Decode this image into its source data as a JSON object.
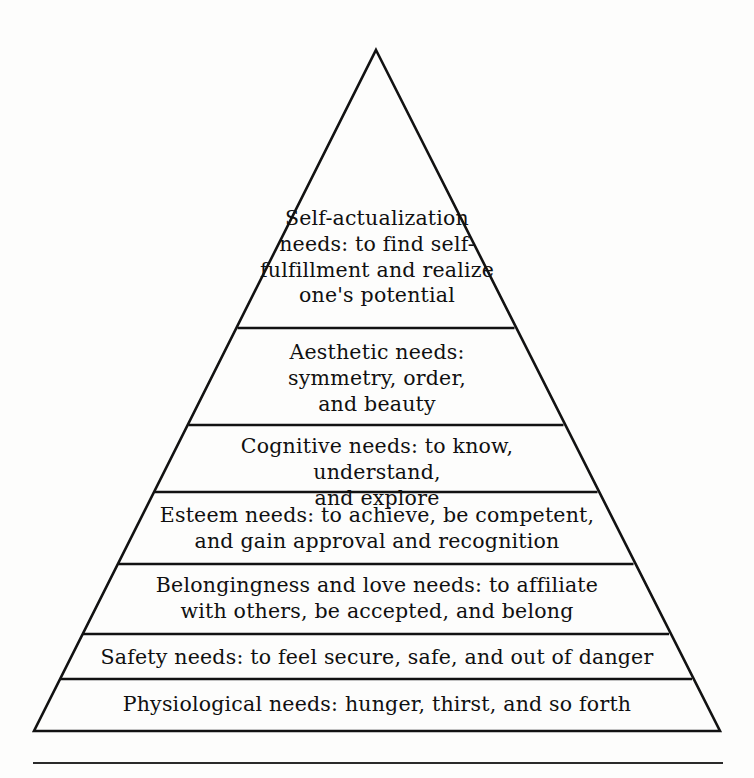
{
  "figure": {
    "type": "pyramid-diagram",
    "background_color": "#fdfdfc",
    "stroke_color": "#121212",
    "text_color": "#101010",
    "apex": {
      "x": 376,
      "y": 50
    },
    "base_left": {
      "x": 34,
      "y": 731
    },
    "base_right": {
      "x": 720,
      "y": 731
    },
    "divider_y_positions": [
      328,
      425,
      492,
      564,
      634,
      679
    ],
    "footer_rule": {
      "x1": 33,
      "x2": 723,
      "y": 763
    }
  },
  "tiers": [
    {
      "index": 1,
      "name": "self-actualization",
      "text": "Self-actualization\nneeds: to find self-\nfulfillment and realize\none's potential",
      "lines": [
        "Self-actualization",
        "needs: to find self-",
        "fulfillment and realize",
        "one's potential"
      ]
    },
    {
      "index": 2,
      "name": "aesthetic",
      "text": "Aesthetic needs:\nsymmetry, order,\nand beauty",
      "lines": [
        "Aesthetic needs:",
        "symmetry, order,",
        "and beauty"
      ]
    },
    {
      "index": 3,
      "name": "cognitive",
      "text": "Cognitive needs: to know, understand,\nand explore",
      "lines": [
        "Cognitive needs: to know, understand,",
        "and explore"
      ]
    },
    {
      "index": 4,
      "name": "esteem",
      "text": "Esteem needs: to achieve, be competent,\nand gain approval and recognition",
      "lines": [
        "Esteem needs: to achieve, be competent,",
        "and gain approval and recognition"
      ]
    },
    {
      "index": 5,
      "name": "belongingness-and-love",
      "text": "Belongingness and love needs: to affiliate\nwith others, be accepted, and belong",
      "lines": [
        "Belongingness and love needs: to affiliate",
        "with others, be accepted, and belong"
      ]
    },
    {
      "index": 6,
      "name": "safety",
      "text": "Safety needs: to feel secure, safe, and out of danger",
      "lines": [
        "Safety needs: to feel secure, safe, and out of danger"
      ]
    },
    {
      "index": 7,
      "name": "physiological",
      "text": "Physiological needs: hunger, thirst, and so forth",
      "lines": [
        "Physiological needs: hunger, thirst, and so forth"
      ]
    }
  ]
}
